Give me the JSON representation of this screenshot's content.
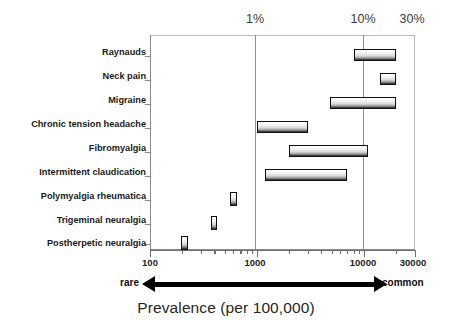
{
  "chart_data": {
    "type": "bar",
    "title": "",
    "caption": "Prevalence (per 100,000)",
    "xlabel": "Prevalence (per 100,000)",
    "ylabel": "",
    "x_scale": "log",
    "xlim": [
      100,
      30000
    ],
    "grid": false,
    "legend": null,
    "orientation": "horizontal",
    "note": "Floating horizontal range bars; each bar spans a low-high prevalence estimate on a log axis.",
    "categories": [
      "Raynauds",
      "Neck pain",
      "Migraine",
      "Chronic tension headache",
      "Fibromyalgia",
      "Intermittent claudication",
      "Polymyalgia rheumatica",
      "Trigeminal neuralgia",
      "Postherpetic neuralgia"
    ],
    "ranges": [
      {
        "category": "Raynauds",
        "low": 8000,
        "high": 20000
      },
      {
        "category": "Neck pain",
        "low": 14000,
        "high": 20000
      },
      {
        "category": "Migraine",
        "low": 4800,
        "high": 20000
      },
      {
        "category": "Chronic tension headache",
        "low": 1000,
        "high": 3000
      },
      {
        "category": "Fibromyalgia",
        "low": 2000,
        "high": 11000
      },
      {
        "category": "Intermittent claudication",
        "low": 1200,
        "high": 7000
      },
      {
        "category": "Polymyalgia rheumatica",
        "low": 560,
        "high": 650
      },
      {
        "category": "Trigeminal neuralgia",
        "low": 370,
        "high": 420
      },
      {
        "category": "Postherpetic neuralgia",
        "low": 195,
        "high": 225
      }
    ],
    "x_major_ticks": [
      100,
      1000,
      10000,
      30000
    ],
    "x_tick_labels": [
      "100",
      "1000",
      "10000",
      "30000"
    ],
    "percent_markers": [
      {
        "label": "1%",
        "value": 1000
      },
      {
        "label": "10%",
        "value": 10000
      },
      {
        "label": "30%",
        "value": 30000
      }
    ],
    "axis_direction": {
      "left": "rare",
      "right": "common"
    },
    "colors": {
      "bar_border": "#101010",
      "bar_fill_top": "#ffffff",
      "bar_fill_bottom": "#2a2a2a",
      "gridline": "#8f8f8f",
      "axis": "#6f6f6f",
      "text": "#1a1a1a",
      "percent_text": "#3a3a3a",
      "background": "#ffffff"
    }
  }
}
